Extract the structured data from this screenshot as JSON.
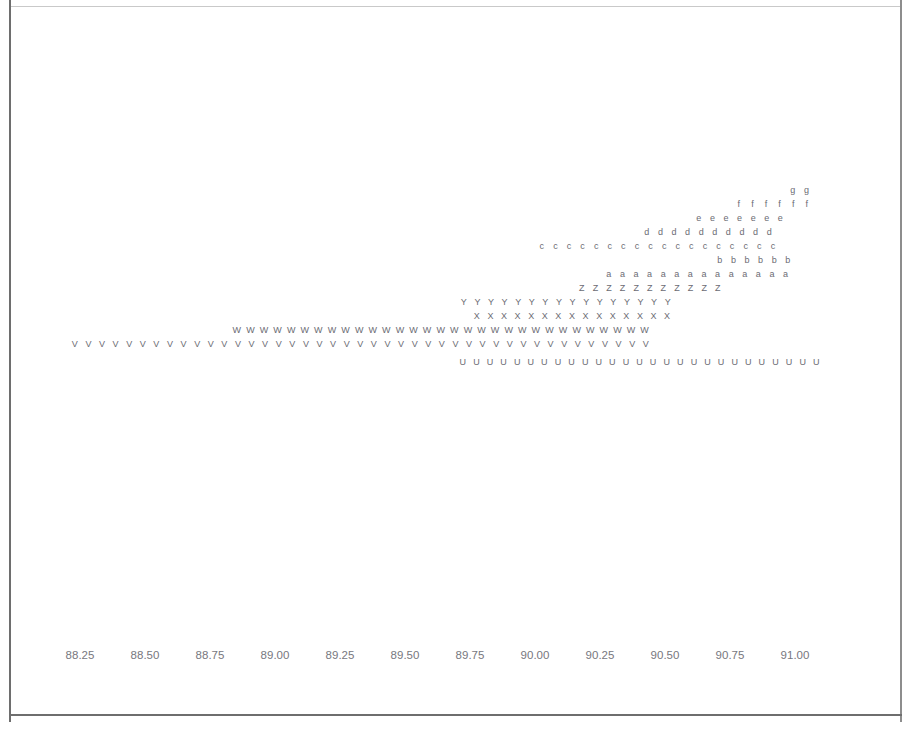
{
  "figure": {
    "type": "letter-value-dot-plot",
    "background_color": "#ffffff",
    "frame_color": "#c9c9c9",
    "glyph_color": "#6b6b73",
    "tick_label_color": "#77777e"
  },
  "chart_data": {
    "type": "scatter",
    "title": "",
    "subtitle": "",
    "xlabel": "",
    "ylabel": "",
    "grid": false,
    "legend": "none",
    "xlim": [
      88.1,
      91.15
    ],
    "xticks": [
      88.25,
      88.5,
      88.75,
      89.0,
      89.25,
      89.5,
      89.75,
      90.0,
      90.25,
      90.5,
      90.75,
      91.0
    ],
    "xticklabels": [
      "88.25",
      "88.50",
      "88.75",
      "89.00",
      "89.25",
      "89.50",
      "89.75",
      "90.00",
      "90.25",
      "90.50",
      "90.75",
      "91.00"
    ],
    "x_spacing_value": 0.0265,
    "series": [
      {
        "name": "g",
        "marker": "g",
        "row": 0,
        "count": 2,
        "x_start": 90.77,
        "x": [
          90.77,
          90.8
        ]
      },
      {
        "name": "f",
        "marker": "f",
        "row": 1,
        "count": 6,
        "x_start": 90.63,
        "x": [
          90.63,
          90.66,
          90.69,
          90.72,
          90.75,
          90.78
        ]
      },
      {
        "name": "e",
        "marker": "e",
        "row": 2,
        "count": 7,
        "x_start": 90.55,
        "x": [
          90.55,
          90.58,
          90.61,
          90.64,
          90.67,
          90.7,
          90.73
        ]
      },
      {
        "name": "d",
        "marker": "d",
        "row": 3,
        "count": 10,
        "x_start": 90.44,
        "x": [
          90.44,
          90.47,
          90.5,
          90.53,
          90.56,
          90.59,
          90.62,
          90.65,
          90.68,
          90.71
        ]
      },
      {
        "name": "c",
        "marker": "c",
        "row": 4,
        "count": 18,
        "x_start": 90.21,
        "x": [
          90.21,
          90.24,
          90.27,
          90.3,
          90.33,
          90.36,
          90.39,
          90.42,
          90.45,
          90.48,
          90.51,
          90.54,
          90.57,
          90.6,
          90.63,
          90.66,
          90.69,
          90.72
        ]
      },
      {
        "name": "b",
        "marker": "b",
        "row": 5,
        "count": 6,
        "x_start": 90.59,
        "x": [
          90.59,
          90.62,
          90.65,
          90.68,
          90.71,
          90.74
        ]
      },
      {
        "name": "a",
        "marker": "a",
        "row": 6,
        "count": 14,
        "x_start": 90.36,
        "x": [
          90.36,
          90.39,
          90.42,
          90.45,
          90.48,
          90.51,
          90.54,
          90.57,
          90.6,
          90.63,
          90.66,
          90.69,
          90.72,
          90.75
        ]
      },
      {
        "name": "Z",
        "marker": "Z",
        "row": 7,
        "count": 11,
        "x_start": 90.3,
        "x": [
          90.3,
          90.33,
          90.36,
          90.39,
          90.42,
          90.45,
          90.48,
          90.51,
          90.54,
          90.57,
          90.6
        ]
      },
      {
        "name": "Y",
        "marker": "Y",
        "row": 8,
        "count": 16,
        "x_start": 90.06,
        "x": [
          90.06,
          90.09,
          90.12,
          90.15,
          90.18,
          90.21,
          90.24,
          90.27,
          90.3,
          90.33,
          90.36,
          90.39,
          90.42,
          90.45,
          90.48,
          90.51
        ]
      },
      {
        "name": "X",
        "marker": "X",
        "row": 9,
        "count": 15,
        "x_start": 90.09,
        "x": [
          90.09,
          90.12,
          90.15,
          90.18,
          90.21,
          90.24,
          90.27,
          90.3,
          90.33,
          90.36,
          90.39,
          90.42,
          90.45,
          90.48,
          90.51
        ]
      },
      {
        "name": "W",
        "marker": "W",
        "row": 10,
        "count": 31,
        "x_start": 89.46,
        "x": [
          89.46,
          89.49,
          89.52,
          89.55,
          89.58,
          89.61,
          89.64,
          89.67,
          89.7,
          89.73,
          89.76,
          89.79,
          89.82,
          89.85,
          89.88,
          89.91,
          89.94,
          89.97,
          90.0,
          90.03,
          90.06,
          90.09,
          90.12,
          90.15,
          90.18,
          90.21,
          90.24,
          90.27,
          90.3,
          90.33,
          90.36
        ]
      },
      {
        "name": "V",
        "marker": "V",
        "row": 11,
        "count": 43,
        "x_start": 89.11,
        "x": [
          89.11,
          89.14,
          89.17,
          89.2,
          89.23,
          89.26,
          89.29,
          89.32,
          89.35,
          89.38,
          89.41,
          89.44,
          89.47,
          89.5,
          89.53,
          89.56,
          89.59,
          89.62,
          89.65,
          89.68,
          89.71,
          89.74,
          89.77,
          89.8,
          89.83,
          89.86,
          89.89,
          89.92,
          89.95,
          89.98,
          90.01,
          90.04,
          90.07,
          90.1,
          90.13,
          90.16,
          90.19,
          90.22,
          90.25,
          90.28,
          90.31,
          90.34,
          90.37
        ]
      },
      {
        "name": "U",
        "marker": "U",
        "row": 12,
        "count": 27,
        "x_start": 90.06,
        "x": [
          90.06,
          90.09,
          90.12,
          90.15,
          90.18,
          90.21,
          90.24,
          90.27,
          90.3,
          90.33,
          90.36,
          90.39,
          90.42,
          90.45,
          90.48,
          90.51,
          90.54,
          90.57,
          90.6,
          90.63,
          90.66,
          90.69,
          90.72,
          90.75,
          90.78,
          90.81,
          90.84
        ]
      }
    ]
  },
  "rows": [
    {
      "marker": "g",
      "count": 2,
      "left_px": 776,
      "top_px": 179,
      "step_px": 13.6
    },
    {
      "marker": "f",
      "count": 6,
      "left_px": 722,
      "top_px": 193,
      "step_px": 13.6
    },
    {
      "marker": "e",
      "count": 7,
      "left_px": 682,
      "top_px": 207,
      "step_px": 13.6
    },
    {
      "marker": "d",
      "count": 10,
      "left_px": 630,
      "top_px": 221,
      "step_px": 13.6
    },
    {
      "marker": "c",
      "count": 18,
      "left_px": 525,
      "top_px": 235,
      "step_px": 13.6
    },
    {
      "marker": "b",
      "count": 6,
      "left_px": 703,
      "top_px": 249,
      "step_px": 13.6
    },
    {
      "marker": "a",
      "count": 14,
      "left_px": 592,
      "top_px": 263,
      "step_px": 13.6
    },
    {
      "marker": "Z",
      "count": 11,
      "left_px": 565,
      "top_px": 277,
      "step_px": 13.6
    },
    {
      "marker": "Y",
      "count": 16,
      "left_px": 447,
      "top_px": 291,
      "step_px": 13.6
    },
    {
      "marker": "X",
      "count": 15,
      "left_px": 460,
      "top_px": 305,
      "step_px": 13.6
    },
    {
      "marker": "W",
      "count": 31,
      "left_px": 220,
      "top_px": 319,
      "step_px": 13.6
    },
    {
      "marker": "V",
      "count": 43,
      "left_px": 58,
      "top_px": 333,
      "step_px": 13.6
    },
    {
      "marker": "U",
      "count": 27,
      "left_px": 446,
      "top_px": 351,
      "step_px": 13.6
    }
  ],
  "xaxis": {
    "labels": [
      {
        "text": "88.25",
        "left_px": 70,
        "top_px": 643
      },
      {
        "text": "88.50",
        "left_px": 135,
        "top_px": 643
      },
      {
        "text": "88.75",
        "left_px": 200,
        "top_px": 643
      },
      {
        "text": "89.00",
        "left_px": 265,
        "top_px": 643
      },
      {
        "text": "89.25",
        "left_px": 330,
        "top_px": 643
      },
      {
        "text": "89.50",
        "left_px": 395,
        "top_px": 643
      },
      {
        "text": "89.75",
        "left_px": 460,
        "top_px": 643
      },
      {
        "text": "90.00",
        "left_px": 525,
        "top_px": 643
      },
      {
        "text": "90.25",
        "left_px": 590,
        "top_px": 643
      },
      {
        "text": "90.50",
        "left_px": 655,
        "top_px": 643
      },
      {
        "text": "90.75",
        "left_px": 720,
        "top_px": 643
      },
      {
        "text": "91.00",
        "left_px": 785,
        "top_px": 643
      }
    ]
  }
}
